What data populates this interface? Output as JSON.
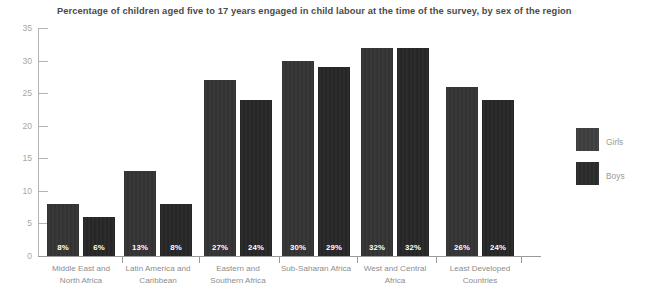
{
  "chart_data": {
    "type": "bar",
    "title": "Percentage of children aged five to 17 years engaged in child labour at the time of the survey, by sex of the region",
    "xlabel": "",
    "ylabel": "",
    "ylim": [
      0,
      35
    ],
    "yticks": [
      0,
      5,
      10,
      15,
      20,
      25,
      30,
      35
    ],
    "grid": false,
    "legend_position": "right",
    "categories": [
      "Middle East and North Africa",
      "Latin America and Caribbean",
      "Eastern and Southern Africa",
      "Sub-Saharan Africa",
      "West and Central Africa",
      "Least Developed Countries"
    ],
    "category_lines": [
      [
        "Middle East and",
        "North Africa"
      ],
      [
        "Latin America and",
        "Caribbean"
      ],
      [
        "Eastern and",
        "Southern Africa"
      ],
      [
        "Sub-Saharan Africa",
        ""
      ],
      [
        "West and Central",
        "Africa"
      ],
      [
        "Least Developed",
        "Countries"
      ]
    ],
    "series": [
      {
        "name": "Girls",
        "color": "#303030",
        "values": [
          8,
          13,
          27,
          30,
          32,
          26
        ],
        "labels": [
          "8%",
          "6%",
          "13%",
          "8%",
          "27%",
          "24%"
        ]
      },
      {
        "name": "Boys",
        "color": "#232323",
        "values": [
          6,
          8,
          24,
          29,
          32,
          24
        ],
        "labels": [
          "6%",
          "8%",
          "24%",
          "29%",
          "32%",
          "24%"
        ]
      }
    ],
    "data_labels": [
      {
        "girls": "8%",
        "boys": "6%"
      },
      {
        "girls": "13%",
        "boys": "8%"
      },
      {
        "girls": "27%",
        "boys": "24%"
      },
      {
        "girls": "30%",
        "boys": "29%"
      },
      {
        "girls": "32%",
        "boys": "32%"
      },
      {
        "girls": "26%",
        "boys": "24%"
      }
    ]
  },
  "legend": {
    "entries": [
      {
        "label": "Girls",
        "swatch": "girls-swatch"
      },
      {
        "label": "Boys",
        "swatch": "boys-swatch"
      }
    ]
  },
  "axes": {
    "y_tick_labels": [
      "35",
      "30",
      "25",
      "20",
      "15",
      "10",
      "5",
      "0"
    ]
  }
}
